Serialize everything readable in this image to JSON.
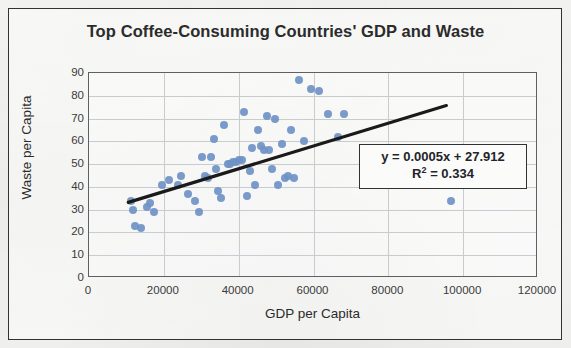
{
  "chart_data": {
    "type": "scatter",
    "title": "Top Coffee-Consuming  Countries' GDP and Waste",
    "xlabel": "GDP per Capita",
    "ylabel": "Waste per Capita",
    "xlim": [
      0,
      120000
    ],
    "ylim": [
      0,
      90
    ],
    "xticks": [
      "0",
      "20000",
      "40000",
      "60000",
      "80000",
      "100000",
      "120000"
    ],
    "xtick_values": [
      0,
      20000,
      40000,
      60000,
      80000,
      100000,
      120000
    ],
    "yticks": [
      "0",
      "10",
      "20",
      "30",
      "40",
      "50",
      "60",
      "70",
      "80",
      "90"
    ],
    "ytick_values": [
      0,
      10,
      20,
      30,
      40,
      50,
      60,
      70,
      80,
      90
    ],
    "grid": true,
    "grid_axes": "both",
    "legend": "none",
    "marker_color": "#6f93c4",
    "trendline_color": "#1a1a1a",
    "annotations": [
      {
        "name": "regression-equation",
        "line1": "y = 0.0005x + 27.912",
        "line2_prefix": "R",
        "line2_sup": "2",
        "line2_suffix": " = 0.334"
      }
    ],
    "trendline": {
      "slope": 0.0005,
      "intercept": 27.912,
      "r_squared": 0.334,
      "x_start": 10500,
      "x_end": 95500,
      "y_start": 33.2,
      "y_end": 75.7
    },
    "points": [
      {
        "x": 11200,
        "y": 34
      },
      {
        "x": 11800,
        "y": 30
      },
      {
        "x": 12400,
        "y": 23
      },
      {
        "x": 13900,
        "y": 22
      },
      {
        "x": 15600,
        "y": 31
      },
      {
        "x": 16400,
        "y": 33
      },
      {
        "x": 17300,
        "y": 29
      },
      {
        "x": 19500,
        "y": 41
      },
      {
        "x": 21500,
        "y": 43
      },
      {
        "x": 23800,
        "y": 41
      },
      {
        "x": 24600,
        "y": 45
      },
      {
        "x": 26500,
        "y": 37
      },
      {
        "x": 28400,
        "y": 34
      },
      {
        "x": 29300,
        "y": 29
      },
      {
        "x": 30100,
        "y": 53
      },
      {
        "x": 31000,
        "y": 45
      },
      {
        "x": 31800,
        "y": 44
      },
      {
        "x": 32600,
        "y": 53
      },
      {
        "x": 33300,
        "y": 61
      },
      {
        "x": 33900,
        "y": 48
      },
      {
        "x": 34500,
        "y": 38
      },
      {
        "x": 35300,
        "y": 35
      },
      {
        "x": 36200,
        "y": 67
      },
      {
        "x": 37100,
        "y": 50
      },
      {
        "x": 37800,
        "y": 50
      },
      {
        "x": 38600,
        "y": 51
      },
      {
        "x": 39400,
        "y": 51
      },
      {
        "x": 40200,
        "y": 52
      },
      {
        "x": 40900,
        "y": 52
      },
      {
        "x": 41500,
        "y": 73
      },
      {
        "x": 42100,
        "y": 36
      },
      {
        "x": 42900,
        "y": 47
      },
      {
        "x": 43600,
        "y": 57
      },
      {
        "x": 44400,
        "y": 41
      },
      {
        "x": 45200,
        "y": 65
      },
      {
        "x": 46000,
        "y": 58
      },
      {
        "x": 46800,
        "y": 56
      },
      {
        "x": 47500,
        "y": 71
      },
      {
        "x": 48200,
        "y": 56
      },
      {
        "x": 49000,
        "y": 48
      },
      {
        "x": 49800,
        "y": 70
      },
      {
        "x": 50600,
        "y": 41
      },
      {
        "x": 51500,
        "y": 59
      },
      {
        "x": 52300,
        "y": 44
      },
      {
        "x": 53200,
        "y": 45
      },
      {
        "x": 54000,
        "y": 65
      },
      {
        "x": 54900,
        "y": 44
      },
      {
        "x": 56000,
        "y": 87
      },
      {
        "x": 57500,
        "y": 60
      },
      {
        "x": 59400,
        "y": 83
      },
      {
        "x": 61500,
        "y": 82
      },
      {
        "x": 63800,
        "y": 72
      },
      {
        "x": 66500,
        "y": 62
      },
      {
        "x": 68200,
        "y": 72
      },
      {
        "x": 96800,
        "y": 34
      }
    ]
  }
}
